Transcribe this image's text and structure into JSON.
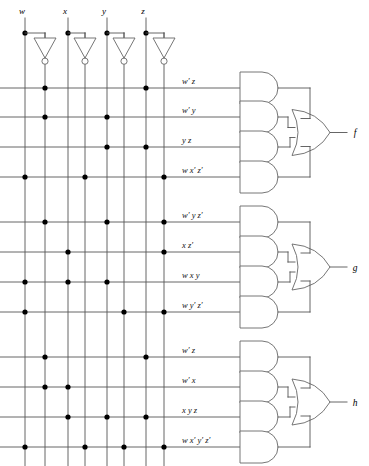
{
  "diagram": {
    "inputs": [
      {
        "name": "w",
        "label": "w"
      },
      {
        "name": "x",
        "label": "x"
      },
      {
        "name": "y",
        "label": "y"
      },
      {
        "name": "z",
        "label": "z"
      }
    ],
    "input_columns": [
      {
        "label": "w",
        "x": 25,
        "kind": "true"
      },
      {
        "label": "w'",
        "x": 45,
        "kind": "complement"
      },
      {
        "label": "x",
        "x": 68,
        "kind": "true"
      },
      {
        "label": "x'",
        "x": 85,
        "kind": "complement"
      },
      {
        "label": "y",
        "x": 107,
        "kind": "true"
      },
      {
        "label": "y'",
        "x": 124,
        "kind": "complement"
      },
      {
        "label": "z",
        "x": 146,
        "kind": "true"
      },
      {
        "label": "z'",
        "x": 164,
        "kind": "complement"
      }
    ],
    "inverters": [
      {
        "for": "w",
        "x": 45
      },
      {
        "for": "x",
        "x": 85
      },
      {
        "for": "y",
        "x": 124
      },
      {
        "for": "z",
        "x": 164
      }
    ],
    "groups": [
      {
        "output": "f",
        "output_label": "f",
        "terms": [
          {
            "label": "w′ z",
            "y": 88,
            "dots": [
              45,
              146
            ]
          },
          {
            "label": "w′ y",
            "y": 117,
            "dots": [
              45,
              107
            ]
          },
          {
            "label": "y z",
            "y": 147,
            "dots": [
              107,
              146
            ]
          },
          {
            "label": "w x′ z′",
            "y": 177,
            "dots": [
              25,
              85,
              164
            ]
          }
        ]
      },
      {
        "output": "g",
        "output_label": "g",
        "terms": [
          {
            "label": "w′ y z′",
            "y": 222,
            "dots": [
              45,
              107,
              164
            ]
          },
          {
            "label": "x z′",
            "y": 252,
            "dots": [
              68,
              164
            ]
          },
          {
            "label": "w x y",
            "y": 282,
            "dots": [
              25,
              68,
              107
            ]
          },
          {
            "label": "w y′ z′",
            "y": 312,
            "dots": [
              25,
              124,
              164
            ]
          }
        ]
      },
      {
        "output": "h",
        "output_label": "h",
        "terms": [
          {
            "label": "w′ z",
            "y": 357,
            "dots": [
              45,
              146
            ]
          },
          {
            "label": "w′ x",
            "y": 387,
            "dots": [
              45,
              68
            ]
          },
          {
            "label": "x y z",
            "y": 417,
            "dots": [
              68,
              107,
              146
            ]
          },
          {
            "label": "w x′ y′ z′",
            "y": 447,
            "dots": [
              25,
              85,
              124,
              164
            ]
          }
        ]
      }
    ],
    "colors": {
      "wire": "#555555",
      "gate_outline": "#666666",
      "dot": "#000000",
      "text": "#000000",
      "background": "#ffffff"
    },
    "geometry": {
      "and_gate_left": 240,
      "and_gate_right": 278,
      "and_gate_height": 32,
      "or_gate_left": 292,
      "or_gate_right": 330,
      "output_x": 355,
      "label_x": 182,
      "top_rail_y": 33,
      "column_bottom": 466
    }
  }
}
